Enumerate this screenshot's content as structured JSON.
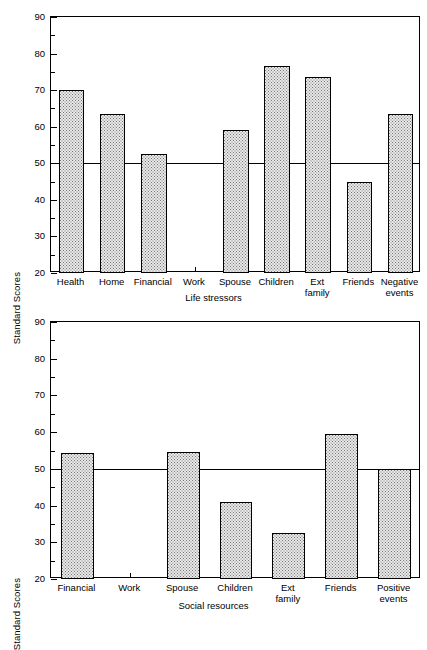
{
  "figure": {
    "y_axis_title": "Standard Scores"
  },
  "chart_data": [
    {
      "type": "bar",
      "title": "",
      "xlabel": "Life stressors",
      "ylabel": "Standard Scores",
      "ylim": [
        20,
        90
      ],
      "yticks": [
        20,
        30,
        40,
        50,
        60,
        70,
        80,
        90
      ],
      "yminorticks": [
        25,
        35,
        45,
        55,
        65,
        75,
        85
      ],
      "grid": false,
      "reference_line": 50,
      "categories": [
        "Health",
        "Home",
        "Financial",
        "Work",
        "Spouse",
        "Children",
        "Ext\nfamily",
        "Friends",
        "Negative\nevents"
      ],
      "values": [
        70,
        63.5,
        52.5,
        null,
        59,
        76.5,
        73.5,
        45,
        63.5
      ],
      "notes": "Work category has no bar plotted"
    },
    {
      "type": "bar",
      "title": "",
      "xlabel": "Social resources",
      "ylabel": "Standard Scores",
      "ylim": [
        20,
        90
      ],
      "yticks": [
        20,
        30,
        40,
        50,
        60,
        70,
        80,
        90
      ],
      "yminorticks": [
        25,
        35,
        45,
        55,
        65,
        75,
        85
      ],
      "grid": false,
      "reference_line": 50,
      "categories": [
        "Financial",
        "Work",
        "Spouse",
        "Children",
        "Ext\nfamily",
        "Friends",
        "Positive\nevents"
      ],
      "values": [
        54.3,
        null,
        54.5,
        41,
        32.5,
        59.5,
        50
      ],
      "notes": "Work category has no bar plotted"
    }
  ],
  "axis_labels": {
    "y": [
      "90",
      "80",
      "70",
      "60",
      "50",
      "40",
      "30",
      "20"
    ]
  }
}
